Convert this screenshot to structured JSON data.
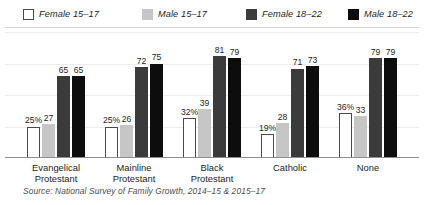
{
  "legend": {
    "items": [
      {
        "label": "Female 15–17",
        "swatch": "white-outline",
        "color": "#ffffff"
      },
      {
        "label": "Male 15–17",
        "swatch": "light-gray",
        "color": "#c6c6c6"
      },
      {
        "label": "Female 18–22",
        "swatch": "dark-gray",
        "color": "#3b3b3b"
      },
      {
        "label": "Male 18–22",
        "swatch": "black",
        "color": "#0d0d0d"
      }
    ]
  },
  "source": "Source: National Survey of Family Growth, 2014–15 & 2015–17",
  "chart_data": {
    "type": "bar",
    "title": "",
    "subtitle": "",
    "xlabel": "",
    "ylabel": "",
    "ylim": [
      0,
      100
    ],
    "grid": true,
    "gridlines": [
      25,
      50,
      75,
      100
    ],
    "legend_position": "top-left",
    "categories": [
      "Evangelical\nProtestant",
      "Mainline\nProtestant",
      "Black\nProtestant",
      "Catholic",
      "None"
    ],
    "series": [
      {
        "name": "Female 15–17",
        "color": "#ffffff",
        "values": [
          25,
          25,
          32,
          19,
          36
        ]
      },
      {
        "name": "Male 15–17",
        "color": "#c6c6c6",
        "values": [
          27,
          26,
          39,
          28,
          33
        ]
      },
      {
        "name": "Female 18–22",
        "color": "#3b3b3b",
        "values": [
          65,
          72,
          81,
          71,
          79
        ]
      },
      {
        "name": "Male 18–22",
        "color": "#0d0d0d",
        "values": [
          65,
          75,
          79,
          73,
          79
        ]
      }
    ],
    "value_labels": [
      [
        "25%",
        "27",
        "65",
        "65"
      ],
      [
        "25%",
        "26",
        "72",
        "75"
      ],
      [
        "32%",
        "39",
        "81",
        "79"
      ],
      [
        "19%",
        "28",
        "71",
        "73"
      ],
      [
        "36%",
        "33",
        "79",
        "79"
      ]
    ]
  }
}
